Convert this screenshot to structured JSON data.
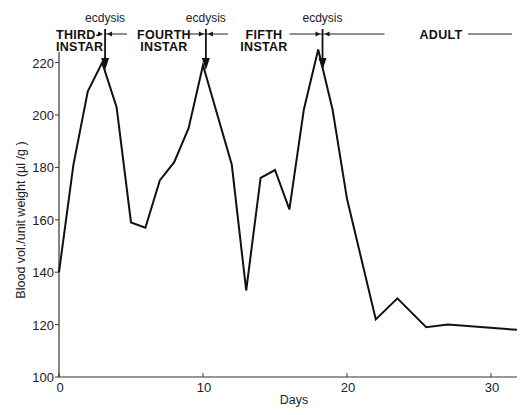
{
  "chart_data": {
    "type": "line",
    "title": "",
    "xlabel": "Days",
    "ylabel": "Blood vol./unit weight (µl /g )",
    "xlim": [
      0,
      31.8
    ],
    "ylim": [
      100,
      225
    ],
    "xticks": [
      0,
      10,
      20,
      30
    ],
    "xtick_labels": [
      "0",
      "10",
      "20",
      "30"
    ],
    "yticks": [
      100,
      120,
      140,
      160,
      180,
      200,
      220
    ],
    "ytick_labels": [
      "100",
      "120",
      "140",
      "160",
      "180",
      "200",
      "220"
    ],
    "grid": false,
    "legend": null,
    "series": [
      {
        "name": "Blood volume",
        "x": [
          0,
          1,
          2,
          3,
          4,
          5,
          6,
          7,
          8,
          9,
          10,
          12,
          13,
          14,
          15,
          16,
          17,
          18,
          19,
          20,
          22,
          23.5,
          25.5,
          27,
          31.8
        ],
        "y": [
          140,
          181,
          209,
          220,
          203,
          159,
          157,
          175,
          182,
          195,
          219,
          181,
          133,
          176,
          179,
          164,
          202,
          225,
          202,
          168,
          122,
          130,
          119,
          120,
          118
        ]
      }
    ],
    "annotations": {
      "ecdysis_label": "ecdysis",
      "ecdysis_days": [
        3.2,
        10.2,
        18.3
      ],
      "stages": [
        {
          "label_line1": "THIRD-",
          "label_line2": "INSTAR"
        },
        {
          "label_line1": "FOURTH",
          "label_line2": "INSTAR"
        },
        {
          "label_line1": "FIFTH",
          "label_line2": "INSTAR"
        },
        {
          "label_line1": "ADULT",
          "label_line2": ""
        }
      ]
    }
  }
}
